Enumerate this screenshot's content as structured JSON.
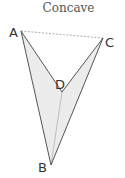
{
  "title": "Concave",
  "vertices": {
    "A": {
      "label": "A",
      "x": 21,
      "y": 31
    },
    "B": {
      "label": "B",
      "x": 51,
      "y": 165
    },
    "C": {
      "label": "C",
      "x": 103,
      "y": 38
    },
    "D": {
      "label": "D",
      "x": 62,
      "y": 92
    }
  },
  "colors": {
    "fill": "#ececec",
    "stroke": "#555555",
    "dashed": "#999999",
    "label": "#333333"
  }
}
